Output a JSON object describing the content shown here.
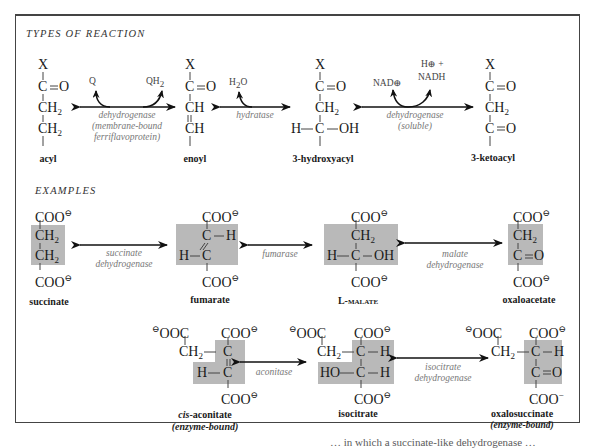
{
  "sections": {
    "types_title": "TYPES OF REACTION",
    "examples_title": "EXAMPLES"
  },
  "types": {
    "molecules": [
      {
        "id": "acyl",
        "name": "acyl",
        "lines": [
          "X",
          "C=O",
          "CH2",
          "CH2"
        ]
      },
      {
        "id": "enoyl",
        "name": "enoyl",
        "lines": [
          "X",
          "C=O",
          "CH",
          "CH"
        ]
      },
      {
        "id": "hydroxyacyl",
        "name": "3-hydroxyacyl",
        "lines": [
          "X",
          "C=O",
          "CH2",
          "H-C-OH"
        ]
      },
      {
        "id": "ketoacyl",
        "name": "3-ketoacyl",
        "lines": [
          "X",
          "C=O",
          "CH2",
          "C=O"
        ]
      }
    ],
    "reactions": [
      {
        "enzyme_line1": "dehydrogenase",
        "enzyme_line2": "(membrane-bound",
        "enzyme_line3": "ferriflavoprotein)",
        "cofactor_in": "Q",
        "cofactor_out": "QH2"
      },
      {
        "enzyme_line1": "hydratase",
        "cofactor_in": "H2O"
      },
      {
        "enzyme_line1": "dehydrogenase",
        "enzyme_line2": "(soluble)",
        "cofactor_in": "NAD⊕",
        "cofactor_out_line1": "H⊕ +",
        "cofactor_out_line2": "NADH"
      }
    ]
  },
  "examples": {
    "row1": [
      {
        "id": "succinate",
        "name": "succinate"
      },
      {
        "id": "fumarate",
        "name": "fumarate"
      },
      {
        "id": "l-malate",
        "name": "L-malate"
      },
      {
        "id": "oxaloacetate",
        "name": "oxaloacetate"
      }
    ],
    "row1_enzymes": [
      {
        "line1": "succinate",
        "line2": "dehydrogenase"
      },
      {
        "line1": "fumarase"
      },
      {
        "line1": "malate",
        "line2": "dehydrogenase"
      }
    ],
    "row2": [
      {
        "id": "cis-aconitate",
        "name_prefix": "cis",
        "name": "-aconitate",
        "note": "(enzyme-bound)"
      },
      {
        "id": "isocitrate",
        "name": "isocitrate"
      },
      {
        "id": "oxalosuccinate",
        "name": "oxalosuccinate",
        "note": "(enzyme-bound)"
      }
    ],
    "row2_enzymes": [
      {
        "line1": "aconitase"
      },
      {
        "line1": "isocitrate",
        "line2": "dehydrogenase"
      }
    ]
  },
  "atoms": {
    "X": "X",
    "C": "C",
    "O": "O",
    "H": "H",
    "CH": "CH",
    "CH2": "CH",
    "sub2": "2",
    "COO": "COO",
    "OOC": "OOC",
    "OH": "OH",
    "HO": "HO",
    "minus": "⊖",
    "minus_plain": "−"
  },
  "colors": {
    "highlight": "#b9b9b9",
    "enzyme_text": "#777777",
    "frame": "#444444"
  },
  "footer_fragment": "… in which a succinate-like dehydrogenase …"
}
